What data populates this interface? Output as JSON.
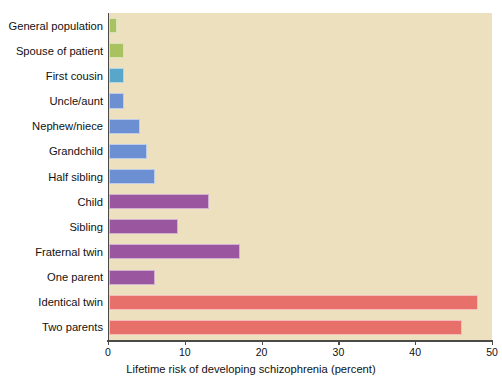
{
  "chart_data": {
    "type": "bar",
    "orientation": "horizontal",
    "title": "",
    "xlabel": "Lifetime risk of developing schizophrenia (percent)",
    "ylabel": "",
    "xlim": [
      0,
      50
    ],
    "xticks": [
      0,
      10,
      20,
      30,
      40,
      50
    ],
    "xtick_labels": [
      "0",
      "10",
      "20",
      "30",
      "40",
      "50"
    ],
    "grid": false,
    "legend": "none",
    "plot_background": "#ece0bf",
    "categories": [
      "General population",
      "Spouse of patient",
      "First cousin",
      "Uncle/aunt",
      "Nephew/niece",
      "Grandchild",
      "Half sibling",
      "Child",
      "Sibling",
      "Fraternal twin",
      "One parent",
      "Identical twin",
      "Two parents"
    ],
    "values": [
      1,
      2,
      2,
      2,
      4,
      5,
      6,
      13,
      9,
      17,
      6,
      48,
      46
    ],
    "colors": [
      "#a9c25f",
      "#a9c25f",
      "#58a7cb",
      "#6b8fd0",
      "#6b8fd0",
      "#6b8fd0",
      "#6b8fd0",
      "#9a569e",
      "#9a569e",
      "#9a569e",
      "#9a569e",
      "#e8706a",
      "#e8706a"
    ]
  },
  "palette": {
    "green": "#a9c25f",
    "teal": "#58a7cb",
    "blue": "#6b8fd0",
    "purple": "#9a569e",
    "red": "#e8706a",
    "plot_bg": "#ece0bf",
    "axis": "#4a4a48",
    "page_bg": "#ffffff"
  }
}
